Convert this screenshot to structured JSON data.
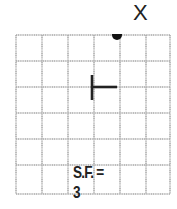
{
  "diagram": {
    "grid": {
      "columns": 6,
      "rows": 6,
      "cell_size_px": 26,
      "line_color": "#a8a8a8"
    },
    "point": {
      "label": "X",
      "grid_col": 4,
      "grid_row": 0,
      "color": "#111111"
    },
    "center_marker": {
      "shape": "T-rotated",
      "grid_col": 3,
      "grid_row": 2,
      "color": "#222222"
    },
    "scale_factor_label": "S.F. = 3"
  }
}
